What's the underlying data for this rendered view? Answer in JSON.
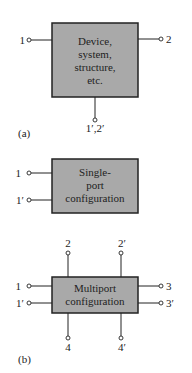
{
  "colors": {
    "box_fill": "#a9a9a9",
    "stroke": "#222222",
    "background": "#ffffff"
  },
  "panel_a": {
    "label": "(a)",
    "box_text": [
      "Device,",
      "system,",
      "structure,",
      "etc."
    ],
    "terminals": {
      "left": "1",
      "right": "2",
      "bottom": "1′,2′"
    }
  },
  "single_port": {
    "box_text": [
      "Single-",
      "port",
      "configuration"
    ],
    "terminals": {
      "top": "1",
      "bottom": "1′"
    }
  },
  "multiport": {
    "label": "(b)",
    "box_text": [
      "Multiport",
      "configuration"
    ],
    "terminals": {
      "left_top": "1",
      "left_bottom": "1′",
      "right_top": "3",
      "right_bottom": "3′",
      "top_left": "2",
      "top_right": "2′",
      "bottom_left": "4",
      "bottom_right": "4′"
    }
  }
}
